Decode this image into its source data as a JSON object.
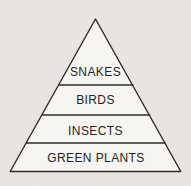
{
  "diagram": {
    "type": "pyramid",
    "levels": [
      {
        "label": "SNAKES"
      },
      {
        "label": "BIRDS"
      },
      {
        "label": "INSECTS"
      },
      {
        "label": "GREEN PLANTS"
      }
    ]
  },
  "colors": {
    "paper": "#e9e6e1",
    "pyramid_fill": "#f6f5f1",
    "line": "#2e2c29",
    "text": "#26241f"
  }
}
